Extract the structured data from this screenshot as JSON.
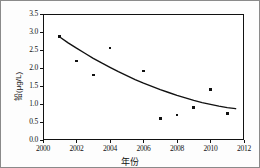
{
  "chart_data": {
    "type": "scatter",
    "title": "",
    "xlabel": "年份",
    "ylabel": "铅(μg/L)",
    "xlim": [
      2000,
      2012
    ],
    "ylim": [
      0.0,
      3.5
    ],
    "grid": false,
    "legend": "none",
    "xticks": [
      "2000",
      "2002",
      "2004",
      "2006",
      "2008",
      "2010",
      "2012"
    ],
    "xtick_values": [
      2000,
      2002,
      2004,
      2006,
      2008,
      2010,
      2012
    ],
    "yticks": [
      "0.0",
      "0.5",
      "1.0",
      "1.5",
      "2.0",
      "2.5",
      "3.0",
      "3.5"
    ],
    "ytick_values": [
      0.0,
      0.5,
      1.0,
      1.5,
      2.0,
      2.5,
      3.0,
      3.5
    ],
    "x": [
      2001,
      2002,
      2003,
      2004,
      2006,
      2007,
      2008,
      2009,
      2010,
      2011
    ],
    "values": [
      2.88,
      2.2,
      1.8,
      2.55,
      1.92,
      0.6,
      0.7,
      0.91,
      1.4,
      0.74
    ],
    "series": [
      {
        "name": "铅(μg/L)",
        "marker": "square",
        "color": "#111111",
        "points": [
          {
            "x": 2001,
            "y": 2.88
          },
          {
            "x": 2002,
            "y": 2.2
          },
          {
            "x": 2003,
            "y": 1.8
          },
          {
            "x": 2004,
            "y": 2.55
          },
          {
            "x": 2006,
            "y": 1.92
          },
          {
            "x": 2007,
            "y": 0.6
          },
          {
            "x": 2008,
            "y": 0.7
          },
          {
            "x": 2009,
            "y": 0.91
          },
          {
            "x": 2010,
            "y": 1.4
          },
          {
            "x": 2011,
            "y": 0.74
          }
        ]
      }
    ],
    "trendline": {
      "type": "exponential-decay",
      "color": "#111111",
      "points": [
        {
          "x": 2001,
          "y": 2.86
        },
        {
          "x": 2001.5,
          "y": 2.7
        },
        {
          "x": 2002,
          "y": 2.55
        },
        {
          "x": 2002.5,
          "y": 2.41
        },
        {
          "x": 2003,
          "y": 2.27
        },
        {
          "x": 2003.5,
          "y": 2.14
        },
        {
          "x": 2004,
          "y": 2.02
        },
        {
          "x": 2004.5,
          "y": 1.9
        },
        {
          "x": 2005,
          "y": 1.79
        },
        {
          "x": 2005.5,
          "y": 1.68
        },
        {
          "x": 2006,
          "y": 1.58
        },
        {
          "x": 2006.5,
          "y": 1.49
        },
        {
          "x": 2007,
          "y": 1.4
        },
        {
          "x": 2007.5,
          "y": 1.32
        },
        {
          "x": 2008,
          "y": 1.24
        },
        {
          "x": 2008.5,
          "y": 1.17
        },
        {
          "x": 2009,
          "y": 1.1
        },
        {
          "x": 2009.5,
          "y": 1.04
        },
        {
          "x": 2010,
          "y": 0.99
        },
        {
          "x": 2010.5,
          "y": 0.94
        },
        {
          "x": 2011,
          "y": 0.9
        },
        {
          "x": 2011.5,
          "y": 0.87
        }
      ]
    }
  }
}
